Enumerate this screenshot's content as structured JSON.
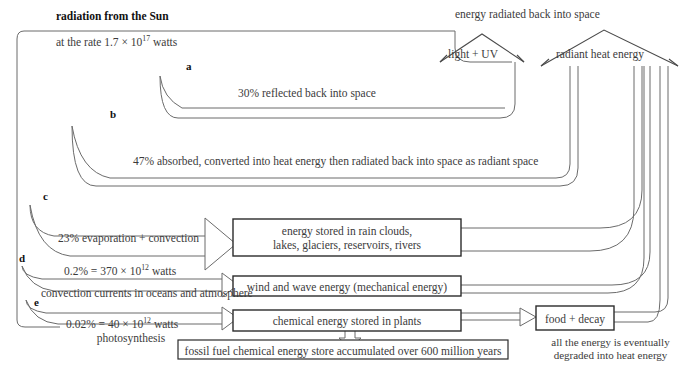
{
  "diagram": {
    "title": "radiation from the Sun",
    "source_rate": "at the rate 1.7 × 10",
    "source_rate_exp": "17",
    "source_rate_tail": " watts",
    "top_caption": "energy radiated back into space",
    "arrow_light_uv": "light + UV",
    "arrow_radiant_heat": "radiant heat energy",
    "branch_letters": [
      "a",
      "b",
      "c",
      "d",
      "e"
    ],
    "flows": [
      {
        "letter": "a",
        "label": "30% reflected back into space"
      },
      {
        "letter": "b",
        "label": "47% absorbed, converted into heat energy then radiated back into space as radiant space"
      },
      {
        "letter": "c",
        "label": "23% evaporation + convection"
      },
      {
        "letter": "d",
        "label_main": "0.2% = 370 × 10",
        "label_exp": "12",
        "label_tail": " watts",
        "label_sub": "convection currents in oceans and atmosphere"
      },
      {
        "letter": "e",
        "label_main": "0.02% = 40 × 10",
        "label_exp": "12",
        "label_tail": " watts",
        "label_sub": "photosynthesis"
      }
    ],
    "boxes": [
      {
        "id": "store-water",
        "line1": "energy stored in rain clouds,",
        "line2": "lakes, glaciers, reservoirs, rivers"
      },
      {
        "id": "wind-wave",
        "line1": "wind and wave energy (mechanical energy)"
      },
      {
        "id": "chemical-plants",
        "line1": "chemical energy stored in plants"
      },
      {
        "id": "fossil-fuel",
        "line1": "fossil fuel chemical energy store accumulated over 600 million years"
      },
      {
        "id": "food-decay",
        "line1": "food + decay"
      }
    ],
    "footnote_line1": "all the energy is eventually",
    "footnote_line2": "degraded into heat energy",
    "colors": {
      "stroke": "#6b6b6b",
      "box_stroke": "#2b2b2b",
      "text": "#3b3b3b",
      "heading": "#111111"
    }
  }
}
